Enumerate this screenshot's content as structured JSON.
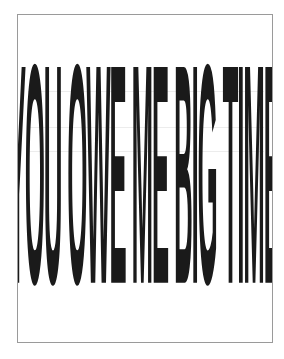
{
  "poster": {
    "text": "YOU OWE ME BIG TIME",
    "text_color": "#1a1a1a",
    "background_color": "#ffffff",
    "border_color": "#9a9a9a"
  }
}
